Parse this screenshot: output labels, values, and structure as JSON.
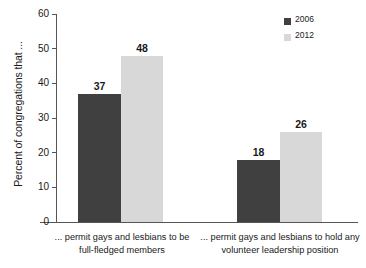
{
  "chart_data": {
    "type": "bar",
    "title": "",
    "xlabel": "",
    "ylabel": "Percent of congregations that ...",
    "ylim": [
      0,
      60
    ],
    "yticks": [
      0,
      10,
      20,
      30,
      40,
      50,
      60
    ],
    "ytick_labels": [
      "0",
      "10",
      "20",
      "30",
      "40",
      "50",
      "60"
    ],
    "grid": false,
    "legend_position": "top-right",
    "categories": [
      "... permit gays and lesbians to be full-fledged members",
      "... permit gays and lesbians to hold any volunteer leadership position"
    ],
    "category_lines": [
      [
        "... permit gays and lesbians to be",
        "full-fledged members"
      ],
      [
        "... permit gays and lesbians to hold any",
        "volunteer leadership position"
      ]
    ],
    "series": [
      {
        "name": "2006",
        "color": "#404040",
        "values": [
          37,
          18
        ],
        "value_labels": [
          "37",
          "18"
        ]
      },
      {
        "name": "2012",
        "color": "#d8d8d8",
        "values": [
          48,
          26
        ],
        "value_labels": [
          "48",
          "26"
        ]
      }
    ]
  },
  "legend": {
    "items": [
      {
        "label": "2006",
        "color": "#404040"
      },
      {
        "label": "2012",
        "color": "#d8d8d8"
      }
    ]
  },
  "axis": {
    "y_title": "Percent of congregations that ...",
    "ticks": [
      "60",
      "50",
      "40",
      "30",
      "20",
      "10",
      "0"
    ]
  },
  "colors": {
    "series_2006": "#404040",
    "series_2012": "#d8d8d8",
    "axis": "#555555",
    "text": "#1a1a1a",
    "background": "#ffffff"
  }
}
